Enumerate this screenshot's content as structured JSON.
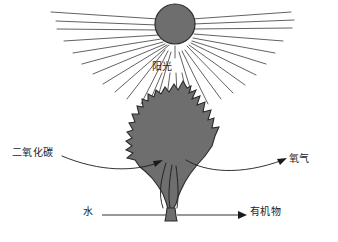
{
  "diagram": {
    "type": "photosynthesis-schematic",
    "canvas": {
      "width": 338,
      "height": 242,
      "background": "#ffffff"
    },
    "colors": {
      "leaf_fill": "#6e6e6e",
      "leaf_stroke": "#2b2b2b",
      "sun_fill": "#6e6e6e",
      "sun_stroke": "#2b2b2b",
      "ray_stroke": "#3a3a3a",
      "arrow_stroke": "#1b1b1b",
      "text": "#1b1b1b"
    },
    "sun": {
      "cx": 175,
      "cy": 24,
      "r": 20,
      "ray_count": 26
    },
    "labels": {
      "sunlight": "阳光",
      "carbon_dioxide": "二氧化碳",
      "oxygen": "氧气",
      "water": "水",
      "organic_matter": "有机物"
    },
    "flows": [
      {
        "name": "sunlight-in",
        "label": "阳光",
        "direction": "down",
        "target": "leaf"
      },
      {
        "name": "carbon-dioxide-in",
        "label": "二氧化碳",
        "direction": "right",
        "target": "leaf"
      },
      {
        "name": "oxygen-out",
        "label": "氧气",
        "direction": "right",
        "target": "air"
      },
      {
        "name": "water-in",
        "label": "水",
        "direction": "right",
        "target": "stem"
      },
      {
        "name": "organic-matter-out",
        "label": "有机物",
        "direction": "right",
        "target": "plant"
      }
    ]
  }
}
